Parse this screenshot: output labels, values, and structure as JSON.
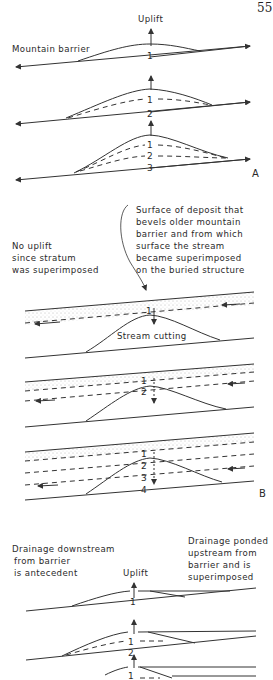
{
  "page_number": "55",
  "panels": {
    "A": {
      "letter": "A",
      "uplift_label": "Uplift",
      "barrier_label": "Mountain barrier",
      "stages": [
        {
          "numbers": [
            "1"
          ]
        },
        {
          "numbers": [
            "1",
            "2"
          ]
        },
        {
          "numbers": [
            "1",
            "2",
            "3"
          ]
        }
      ]
    },
    "B": {
      "letter": "B",
      "left_note": [
        "No uplift",
        "since stratum",
        "was superimposed"
      ],
      "right_note": [
        "Surface of deposit that",
        "bevels older mountain",
        "barrier and from which",
        "surface the stream",
        "became superimposed",
        "on the buried structure"
      ],
      "stream_cutting_label": "Stream cutting",
      "stages": [
        {
          "numbers": [
            "1"
          ]
        },
        {
          "numbers": [
            "1",
            "2"
          ]
        },
        {
          "numbers": [
            "1",
            "2",
            "3",
            "4"
          ]
        }
      ]
    },
    "C": {
      "left_note": [
        "Drainage downstream",
        "from barrier",
        "is antecedent"
      ],
      "right_note": [
        "Drainage ponded",
        "upstream from",
        "barrier and is",
        "superimposed"
      ],
      "uplift_label": "Uplift",
      "stages": [
        {
          "numbers": [
            "1"
          ]
        },
        {
          "numbers": [
            "1",
            "2"
          ]
        },
        {
          "numbers": [
            "1"
          ]
        }
      ]
    }
  }
}
